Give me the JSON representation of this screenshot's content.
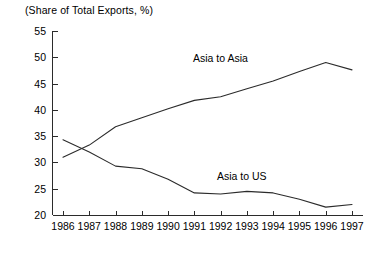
{
  "chart_data": {
    "type": "line",
    "title": "(Share of Total Exports, %)",
    "xlabel": "",
    "ylabel": "",
    "ylim": [
      20,
      55
    ],
    "ytick_labels": [
      "20",
      "25",
      "30",
      "35",
      "40",
      "45",
      "50",
      "55"
    ],
    "yticks": [
      20,
      25,
      30,
      35,
      40,
      45,
      50,
      55
    ],
    "grid": false,
    "legend": "inline-annotation",
    "categories": [
      "1986",
      "1987",
      "1988",
      "1989",
      "1990",
      "1991",
      "1992",
      "1993",
      "1994",
      "1995",
      "1996",
      "1997"
    ],
    "x": [
      1986,
      1987,
      1988,
      1989,
      1990,
      1991,
      1992,
      1993,
      1994,
      1995,
      1996,
      1997
    ],
    "series": [
      {
        "name": "Asia to Asia",
        "label_text": "Asia to Asia",
        "values": [
          31.0,
          33.3,
          36.8,
          38.5,
          40.2,
          41.8,
          42.5,
          44.0,
          45.5,
          47.3,
          49.0,
          47.6
        ]
      },
      {
        "name": "Asia to US",
        "label_text": "Asia to US",
        "values": [
          34.3,
          32.0,
          29.3,
          28.8,
          26.8,
          24.2,
          24.0,
          24.5,
          24.2,
          23.0,
          21.5,
          22.0
        ]
      }
    ],
    "annotations": [
      {
        "text": "Asia to Asia",
        "x_px": 193,
        "y_px": 52
      },
      {
        "text": "Asia to US",
        "x_px": 217,
        "y_px": 170
      }
    ],
    "colors": {
      "line": "#2b2b2b",
      "axis": "#2b2b2b",
      "background": "#ffffff"
    }
  }
}
